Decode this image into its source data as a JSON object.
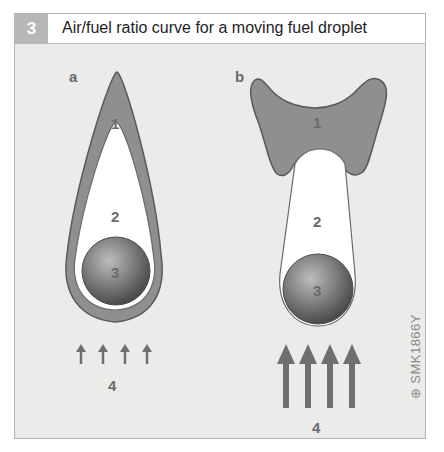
{
  "figure": {
    "number": "3",
    "title": "Air/fuel ratio curve for a moving fuel droplet",
    "code": "⊕ SMK1866Y"
  },
  "panels": [
    {
      "id": "a",
      "label": "a",
      "zones": [
        {
          "number": "1",
          "description": "outer combustion zone"
        },
        {
          "number": "2",
          "description": "inner vapour zone"
        },
        {
          "number": "3",
          "description": "fuel droplet"
        }
      ],
      "flow_label": "4",
      "flow_arrows": 4,
      "flow_strength": "low"
    },
    {
      "id": "b",
      "label": "b",
      "zones": [
        {
          "number": "1",
          "description": "combustion zone"
        },
        {
          "number": "2",
          "description": "vapour zone"
        },
        {
          "number": "3",
          "description": "fuel droplet"
        }
      ],
      "flow_label": "4",
      "flow_arrows": 4,
      "flow_strength": "high"
    }
  ],
  "colors": {
    "zone1": "#8f8f8f",
    "zone2": "#ffffff",
    "droplet": "#7a7a7a",
    "arrows": "#6f6f6f",
    "background": "#ebebea"
  }
}
